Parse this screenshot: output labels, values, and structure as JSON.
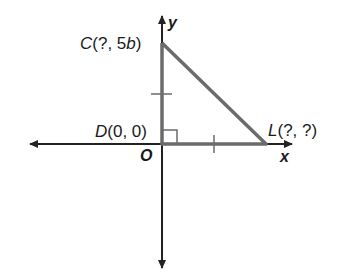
{
  "figure": {
    "axes": {
      "x_label": "x",
      "y_label": "y",
      "origin_label": "O"
    },
    "points": [
      {
        "name": "C",
        "coords": "(?, 5b)",
        "paren_open": "(?, 5",
        "var": "b",
        "paren_close": ")"
      },
      {
        "name": "D",
        "coords": "(0, 0)"
      },
      {
        "name": "L",
        "coords": "(?, ?)"
      }
    ],
    "shape": "right triangle CDL",
    "right_angle_at": "D",
    "congruence_ticks": [
      "segment DC",
      "segment DL"
    ],
    "colors": {
      "triangle": "#6b6b6b",
      "axis": "#222222",
      "text": "#1a1a1a"
    }
  }
}
